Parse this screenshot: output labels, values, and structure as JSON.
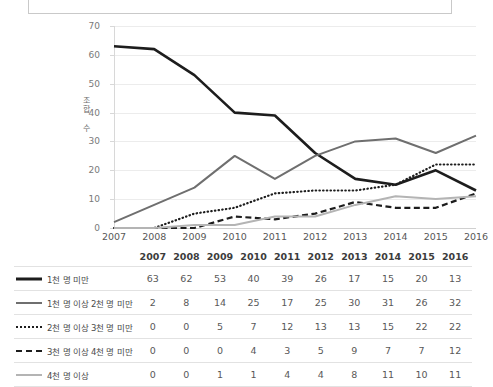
{
  "title": {
    "text": "조합원 규모별 신협 조합 수 추이"
  },
  "chart_data": {
    "type": "line",
    "title": "조합원 규모별 신협 조합 수 추이",
    "xlabel": "",
    "ylabel": "조합 수",
    "categories": [
      "2007",
      "2008",
      "2009",
      "2010",
      "2011",
      "2012",
      "2013",
      "2014",
      "2015",
      "2016"
    ],
    "ylim": [
      0,
      70
    ],
    "yticks": [
      0,
      10,
      20,
      30,
      40,
      50,
      60,
      70
    ],
    "grid": true,
    "legend_position": "table-left",
    "series": [
      {
        "name": "1천 명 미만",
        "style": "solid-thick",
        "color": "#1d1d1d",
        "values": [
          63,
          62,
          53,
          40,
          39,
          26,
          17,
          15,
          20,
          13
        ]
      },
      {
        "name": "1천 명 이상 2천 명 미만",
        "style": "solid-medium",
        "color": "#6f6f6f",
        "values": [
          2,
          8,
          14,
          25,
          17,
          25,
          30,
          31,
          26,
          32
        ]
      },
      {
        "name": "2천 명 이상 3천 명 미만",
        "style": "dotted",
        "color": "#1d1d1d",
        "values": [
          0,
          0,
          5,
          7,
          12,
          13,
          13,
          15,
          22,
          22
        ]
      },
      {
        "name": "3천 명 이상 4천 명 미만",
        "style": "dashed",
        "color": "#1d1d1d",
        "values": [
          0,
          0,
          0,
          4,
          3,
          5,
          9,
          7,
          7,
          12
        ]
      },
      {
        "name": "4천 명 이상",
        "style": "solid-light",
        "color": "#b4b4b4",
        "values": [
          0,
          0,
          1,
          1,
          4,
          4,
          8,
          11,
          10,
          11
        ]
      }
    ]
  },
  "table": {
    "header": [
      "2007",
      "2008",
      "2009",
      "2010",
      "2011",
      "2012",
      "2013",
      "2014",
      "2015",
      "2016"
    ],
    "rows": [
      {
        "label": "1천 명 미만",
        "values": [
          "63",
          "62",
          "53",
          "40",
          "39",
          "26",
          "17",
          "15",
          "20",
          "13"
        ]
      },
      {
        "label": "1천 명 이상 2천 명 미만",
        "values": [
          "2",
          "8",
          "14",
          "25",
          "17",
          "25",
          "30",
          "31",
          "26",
          "32"
        ]
      },
      {
        "label": "2천 명 이상 3천 명 미만",
        "values": [
          "0",
          "0",
          "5",
          "7",
          "12",
          "13",
          "13",
          "15",
          "22",
          "22"
        ]
      },
      {
        "label": "3천 명 이상 4천 명 미만",
        "values": [
          "0",
          "0",
          "0",
          "4",
          "3",
          "5",
          "9",
          "7",
          "7",
          "12"
        ]
      },
      {
        "label": "4천 명 이상",
        "values": [
          "0",
          "0",
          "1",
          "1",
          "4",
          "4",
          "8",
          "11",
          "10",
          "11"
        ]
      }
    ]
  }
}
